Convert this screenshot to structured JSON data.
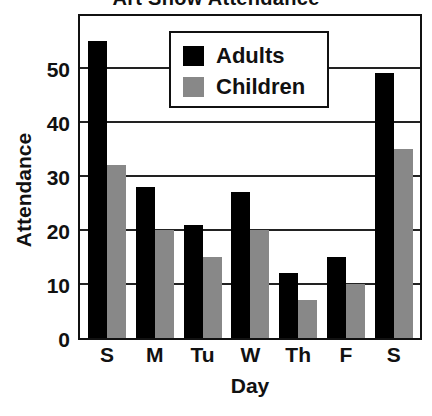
{
  "chart_data": {
    "type": "bar",
    "title": "Art Show Attendance",
    "xlabel": "Day",
    "ylabel": "Attendance",
    "categories": [
      "S",
      "M",
      "Tu",
      "W",
      "Th",
      "F",
      "S"
    ],
    "series": [
      {
        "name": "Adults",
        "color": "#000000",
        "values": [
          55,
          28,
          21,
          27,
          12,
          15,
          49
        ]
      },
      {
        "name": "Children",
        "color": "#888888",
        "values": [
          32,
          20,
          15,
          20,
          7,
          10,
          35
        ]
      }
    ],
    "ylim": [
      0,
      60
    ],
    "yticks": [
      0,
      10,
      20,
      30,
      40,
      50
    ],
    "grid": true,
    "legend_position": "top-center"
  },
  "labels": {
    "title": "Art Show Attendance",
    "xlabel": "Day",
    "ylabel": "Attendance",
    "yticks": [
      "0",
      "10",
      "20",
      "30",
      "40",
      "50"
    ],
    "xticks": [
      "S",
      "M",
      "Tu",
      "W",
      "Th",
      "F",
      "S"
    ],
    "legend": [
      "Adults",
      "Children"
    ]
  }
}
